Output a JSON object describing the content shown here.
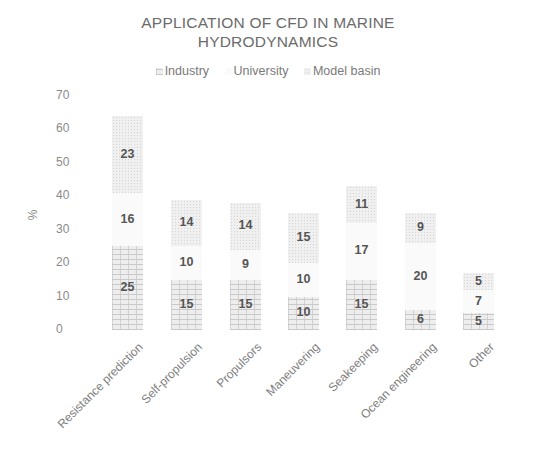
{
  "chart_data": {
    "type": "bar",
    "stacked": true,
    "title": "APPLICATION OF CFD IN MARINE HYDRODYNAMICS",
    "title_lines": [
      "APPLICATION OF CFD IN MARINE",
      "HYDRODYNAMICS"
    ],
    "xlabel": "",
    "ylabel": "%",
    "ylim": [
      0,
      70
    ],
    "yticks": [
      0,
      10,
      20,
      30,
      40,
      50,
      60,
      70
    ],
    "grid": false,
    "legend_position": "top",
    "categories": [
      "Resistance prediction",
      "Self-propulsion",
      "Propulsors",
      "Maneuvering",
      "Seakeeping",
      "Ocean engineering",
      "Other"
    ],
    "series": [
      {
        "name": "Industry",
        "values": [
          25,
          15,
          15,
          10,
          15,
          6,
          5
        ]
      },
      {
        "name": "University",
        "values": [
          16,
          10,
          9,
          10,
          17,
          20,
          7
        ]
      },
      {
        "name": "Model basin",
        "values": [
          23,
          14,
          14,
          15,
          11,
          9,
          5
        ]
      }
    ]
  },
  "legend": {
    "items": [
      {
        "label": "Industry"
      },
      {
        "label": "University"
      },
      {
        "label": "Model basin"
      }
    ]
  }
}
